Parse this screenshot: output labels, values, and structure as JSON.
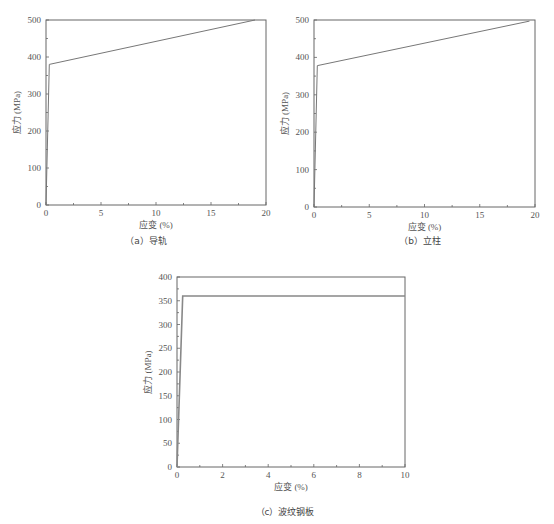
{
  "chart_data": [
    {
      "id": "a",
      "type": "line",
      "caption": "（a）导轨",
      "xlabel": "应变 (%)",
      "ylabel": "应力 (MPa)",
      "xlim": [
        0,
        20
      ],
      "ylim": [
        0,
        500
      ],
      "xticks": [
        0,
        5,
        10,
        15,
        20
      ],
      "yticks": [
        0,
        100,
        200,
        300,
        400,
        500
      ],
      "series": [
        {
          "name": "导轨",
          "x": [
            0,
            0.3,
            19
          ],
          "y": [
            0,
            380,
            500
          ]
        }
      ],
      "frame": {
        "left": 46,
        "top": 20,
        "right": 266,
        "bottom": 205
      }
    },
    {
      "id": "b",
      "type": "line",
      "caption": "（b）立柱",
      "xlabel": "应变 (%)",
      "ylabel": "应力 (MPa)",
      "xlim": [
        0,
        20
      ],
      "ylim": [
        0,
        500
      ],
      "xticks": [
        0,
        5,
        10,
        15,
        20
      ],
      "yticks": [
        0,
        100,
        200,
        300,
        400,
        500
      ],
      "series": [
        {
          "name": "立柱",
          "x": [
            0,
            0.3,
            19.5
          ],
          "y": [
            0,
            378,
            497
          ]
        }
      ],
      "frame": {
        "left": 314,
        "top": 20,
        "right": 535,
        "bottom": 207
      }
    },
    {
      "id": "c",
      "type": "line",
      "caption": "（c）波纹钢板",
      "xlabel": "应变 (%)",
      "ylabel": "应力 (MPa)",
      "xlim": [
        0,
        10
      ],
      "ylim": [
        0,
        400
      ],
      "xticks": [
        0,
        2,
        4,
        6,
        8,
        10
      ],
      "yticks": [
        0,
        50,
        100,
        150,
        200,
        250,
        300,
        350,
        400
      ],
      "series": [
        {
          "name": "波纹钢板",
          "x": [
            0,
            0.25,
            10
          ],
          "y": [
            0,
            360,
            360
          ]
        }
      ],
      "frame": {
        "left": 177,
        "top": 277,
        "right": 405,
        "bottom": 467
      }
    }
  ],
  "captions": {
    "a": "（a）导轨",
    "b": "（b）立柱",
    "c": "（c）波纹钢板"
  }
}
